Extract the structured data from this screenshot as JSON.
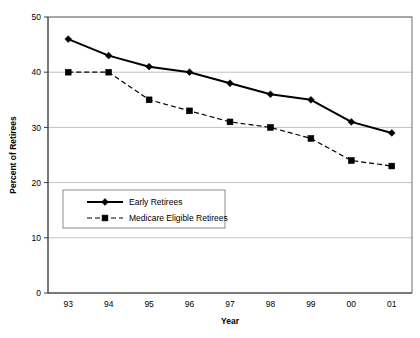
{
  "chart_data": {
    "type": "line",
    "title": "",
    "xlabel": "Year",
    "ylabel": "Percent of Retirees",
    "categories": [
      "93",
      "94",
      "95",
      "96",
      "97",
      "98",
      "99",
      "00",
      "01"
    ],
    "ylim": [
      0,
      50
    ],
    "yticks": [
      0,
      10,
      20,
      30,
      40,
      50
    ],
    "ytick_labels": [
      "0",
      "10",
      "20",
      "30",
      "40",
      "50"
    ],
    "grid": true,
    "grid_axis": "y",
    "legend_position": "center-left-inside",
    "series": [
      {
        "name": "Early Retirees",
        "values": [
          46,
          43,
          41,
          40,
          38,
          36,
          35,
          31,
          29
        ],
        "line_style": "solid",
        "marker": "diamond",
        "color": "#000000"
      },
      {
        "name": "Medicare Eligible Retirees",
        "values": [
          40,
          40,
          35,
          33,
          31,
          30,
          28,
          24,
          23
        ],
        "line_style": "dashed",
        "marker": "square",
        "color": "#000000"
      }
    ]
  },
  "legend": {
    "items": [
      {
        "label": "Early Retirees"
      },
      {
        "label": "Medicare Eligible Retirees"
      }
    ]
  },
  "axes": {
    "x_title": "Year",
    "y_title": "Percent of Retirees"
  },
  "colors": {
    "series": "#000000",
    "grid": "#a8a8a8",
    "frame": "#6e6e6e",
    "background": "#ffffff"
  }
}
